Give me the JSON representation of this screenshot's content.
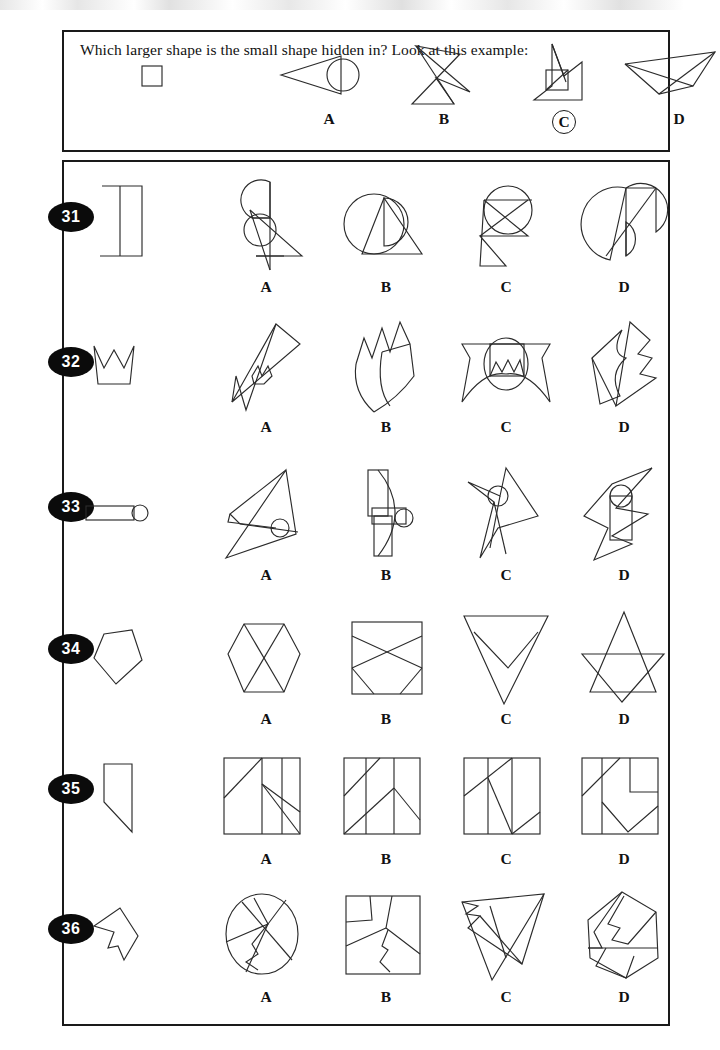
{
  "page": {
    "kind": "hidden-figures-test-page",
    "background_color": "#ffffff",
    "ink_color": "#2b2b2b"
  },
  "example": {
    "prompt": "Which larger shape is the small shape hidden in?  Look at this example:",
    "stem_shape_name": "small-square",
    "options": [
      {
        "letter": "A",
        "shape_name": "cone-with-circle"
      },
      {
        "letter": "B",
        "shape_name": "crossed-bowtie-arrow"
      },
      {
        "letter": "C",
        "shape_name": "flag-with-embedded-square",
        "circled": true
      },
      {
        "letter": "D",
        "shape_name": "paper-dart"
      }
    ],
    "answer_letter": "C"
  },
  "questions": [
    {
      "number": "31",
      "stem_shape_name": "z-zigzag",
      "options": [
        {
          "letter": "A",
          "shape_name": "arc-triangle-circle-cluster"
        },
        {
          "letter": "B",
          "shape_name": "circle-with-triangle-tail"
        },
        {
          "letter": "C",
          "shape_name": "circle-over-hourglass"
        },
        {
          "letter": "D",
          "shape_name": "circle-leaf-split"
        }
      ]
    },
    {
      "number": "32",
      "stem_shape_name": "crown",
      "options": [
        {
          "letter": "A",
          "shape_name": "diagonal-spike-crown"
        },
        {
          "letter": "B",
          "shape_name": "curved-fan-crown"
        },
        {
          "letter": "C",
          "shape_name": "banner-with-circle-crown"
        },
        {
          "letter": "D",
          "shape_name": "angular-star-crown"
        }
      ]
    },
    {
      "number": "33",
      "stem_shape_name": "rod-with-ball",
      "options": [
        {
          "letter": "A",
          "shape_name": "triangle-wing-with-ball"
        },
        {
          "letter": "B",
          "shape_name": "arc-rectangles-with-ball"
        },
        {
          "letter": "C",
          "shape_name": "pinwheel-with-ball"
        },
        {
          "letter": "D",
          "shape_name": "kite-rod-with-ball"
        }
      ]
    },
    {
      "number": "34",
      "stem_shape_name": "pentagon",
      "options": [
        {
          "letter": "A",
          "shape_name": "hexagon-with-crossed-lines"
        },
        {
          "letter": "B",
          "shape_name": "square-with-crossed-lines"
        },
        {
          "letter": "C",
          "shape_name": "inverted-triangle-with-notch"
        },
        {
          "letter": "D",
          "shape_name": "six-point-star"
        }
      ]
    },
    {
      "number": "35",
      "stem_shape_name": "right-trapezoid",
      "options": [
        {
          "letter": "A",
          "shape_name": "square-with-diagonals-a"
        },
        {
          "letter": "B",
          "shape_name": "square-with-diagonals-b"
        },
        {
          "letter": "C",
          "shape_name": "square-with-diagonals-c"
        },
        {
          "letter": "D",
          "shape_name": "square-with-diagonals-d"
        }
      ]
    },
    {
      "number": "36",
      "stem_shape_name": "dart-zigzag",
      "options": [
        {
          "letter": "A",
          "shape_name": "circle-with-zigzag-lines"
        },
        {
          "letter": "B",
          "shape_name": "square-with-zigzag-partition"
        },
        {
          "letter": "C",
          "shape_name": "triangle-with-zigzag-lines"
        },
        {
          "letter": "D",
          "shape_name": "pentagon-with-zigzag-partition"
        }
      ]
    }
  ]
}
